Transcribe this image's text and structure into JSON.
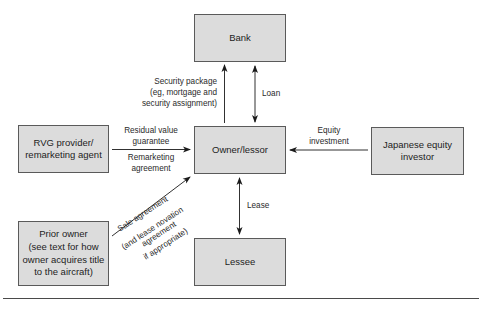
{
  "diagram": {
    "type": "flow",
    "nodes": {
      "bank": "Bank",
      "owner": "Owner/lessor",
      "lessee": "Lessee",
      "rvg": "RVG provider/\nremarketing agent",
      "investor": "Japanese equity\ninvestor",
      "prior": "Prior owner\n(see text for how\nowner acquires title\nto the aircraft)"
    },
    "edges": {
      "security": "Security package\n(eg, mortgage and\nsecurity assignment)",
      "loan": "Loan",
      "rvg_top": "Residual value\nguarantee",
      "rvg_bottom": "Remarketing\nagreement",
      "equity": "Equity\ninvestment",
      "lease": "Lease",
      "sale_line1": "Sale agreement",
      "sale_line2": "(and lease novation",
      "sale_line3": "agreement",
      "sale_line4": "if appropriate)"
    },
    "colors": {
      "box_fill": "#dcdcdc",
      "box_border": "#5a5a5a",
      "line": "#1a1a1a"
    }
  }
}
